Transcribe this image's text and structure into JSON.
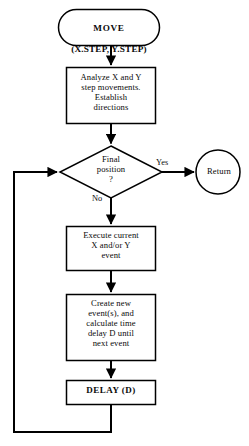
{
  "diagram": {
    "background_color": "#ffffff",
    "stroke_color": "#000000",
    "nodes": {
      "start": {
        "shape": "terminal-rounded",
        "line1": "MOVE",
        "line2": "(X.STEP, Y.STEP)"
      },
      "analyze": {
        "shape": "process-rectangle",
        "text": "Analyze X and Y\nstep movements.\nEstablish\ndirections"
      },
      "decision": {
        "shape": "decision-diamond",
        "text": "Final\nposition\n?"
      },
      "return": {
        "shape": "terminal-circle",
        "text": "Return"
      },
      "execute": {
        "shape": "process-rectangle",
        "text": "Execute current\nX and/or Y\nevent"
      },
      "create": {
        "shape": "process-rectangle",
        "text": "Create new\nevent(s), and\ncalculate time\ndelay D until\nnext event"
      },
      "delay": {
        "shape": "process-rectangle",
        "text": "DELAY (D)"
      }
    },
    "edges": {
      "yes_label": "Yes",
      "no_label": "No"
    }
  }
}
